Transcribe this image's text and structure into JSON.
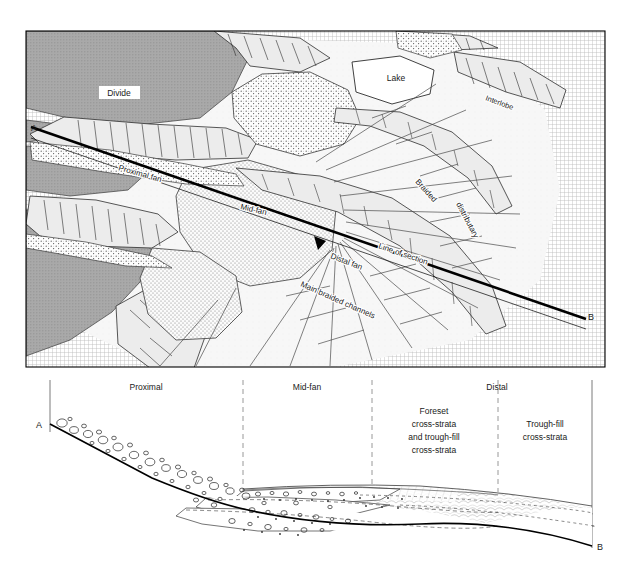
{
  "figure": {
    "type": "geological-diagram",
    "background_color": "#ffffff",
    "ink_color": "#1a1a1a"
  },
  "map": {
    "name": "fan-map-panel",
    "frame": {
      "x": 26,
      "y": 31,
      "width": 579,
      "height": 336
    },
    "endpoint_a": "A",
    "endpoint_b": "B",
    "labels": [
      {
        "id": "divide",
        "text": "Divide",
        "x": 118,
        "y": 94,
        "rotation": 0,
        "boxed": true,
        "size": 8.5
      },
      {
        "id": "lake",
        "text": "Lake",
        "x": 396,
        "y": 79,
        "rotation": 0,
        "boxed": true,
        "size": 8.5
      },
      {
        "id": "interlobe",
        "text": "Interlobe",
        "x": 497,
        "y": 104,
        "rotation": 20,
        "boxed": false,
        "size": 7.5
      },
      {
        "id": "proximal",
        "text": "Proximal fan",
        "x": 128,
        "y": 168,
        "rotation": 16,
        "boxed": false,
        "size": 8
      },
      {
        "id": "midfan",
        "text": "Mid-fan",
        "x": 255,
        "y": 207,
        "rotation": 13,
        "boxed": false,
        "size": 8
      },
      {
        "id": "braided",
        "text": "Braided",
        "x": 424,
        "y": 188,
        "rotation": 48,
        "boxed": false,
        "size": 8
      },
      {
        "id": "distrib",
        "text": "distributary",
        "x": 472,
        "y": 214,
        "rotation": 62,
        "boxed": false,
        "size": 8
      },
      {
        "id": "lineofsec",
        "text": "Line of section",
        "x": 407,
        "y": 252,
        "rotation": 19,
        "boxed": false,
        "size": 8
      },
      {
        "id": "distalfan",
        "text": "Distal fan",
        "x": 350,
        "y": 262,
        "rotation": 21,
        "boxed": false,
        "size": 8
      },
      {
        "id": "mainbr",
        "text": "Main braided channels",
        "x": 333,
        "y": 292,
        "rotation": 24,
        "boxed": false,
        "size": 8
      }
    ],
    "line_of_section": {
      "from": {
        "x": 31,
        "y": 127
      },
      "to": {
        "x": 586,
        "y": 319
      },
      "arrow_at": {
        "x": 320,
        "y": 243
      }
    },
    "legend_colors": {
      "divide_upland": "#a9a9a9",
      "stipple_fan": "#d8d8d8",
      "open_fan": "#f4f4f4",
      "lake_white": "#ffffff",
      "grid_margin": "#cfcfcf"
    }
  },
  "section": {
    "name": "cross-section-panel",
    "endpoint_a": "A",
    "endpoint_b": "B",
    "boundary_lines": [
      {
        "id": "left-edge",
        "x": 50,
        "style": "solid"
      },
      {
        "id": "prox-mid",
        "x": 243,
        "style": "dashed"
      },
      {
        "id": "mid-foreset",
        "x": 372,
        "style": "dashed"
      },
      {
        "id": "distal-div",
        "x": 498,
        "style": "dashed"
      },
      {
        "id": "right-edge",
        "x": 592,
        "style": "solid"
      }
    ],
    "zone_labels": [
      {
        "id": "proximal",
        "text": "Proximal",
        "x": 146,
        "y": 388
      },
      {
        "id": "mid-fan",
        "text": "Mid-fan",
        "x": 307,
        "y": 388
      },
      {
        "id": "distal",
        "text": "Distal",
        "x": 497,
        "y": 388
      }
    ],
    "facies_labels": [
      {
        "id": "foreset-block",
        "x": 434,
        "y": 412,
        "lines": [
          "Foreset",
          "cross-strata",
          "and trough-fill",
          "cross-strata"
        ]
      },
      {
        "id": "trough-block",
        "x": 545,
        "y": 424,
        "lines": [
          "Trough-fill",
          "cross-strata"
        ]
      }
    ],
    "profile": {
      "a_point": {
        "x": 50,
        "y": 424
      },
      "b_point": {
        "x": 592,
        "y": 546
      },
      "break_1": {
        "x": 152,
        "y": 478
      },
      "break_2": {
        "x": 243,
        "y": 507
      },
      "description": "Basal surface steepens at proximal fan, flattens through mid-fan and distal reaches"
    },
    "facies_description": {
      "proximal": "open-framework boulder/cobble gravel, large clasts",
      "mid_fan": "interbedded pebble gravel and sandy lenses, imbricated",
      "distal": "sandy foreset and trough cross-strata, fine laminated"
    }
  }
}
